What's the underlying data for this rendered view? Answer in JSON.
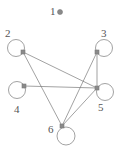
{
  "figure": {
    "type": "graph-diagram",
    "width": 124,
    "height": 149,
    "background_color": "#ffffff",
    "edge_color": "#7a7a7a",
    "node_stroke_color": "#7a7a7a",
    "node_marker_color": "#8a8a8a",
    "label_color": "#555555"
  },
  "nodes": [
    {
      "id": "1",
      "label": "1",
      "label_x": 50,
      "label_y": 6,
      "marker_x": 60,
      "marker_y": 12,
      "marker_shape": "circle",
      "marker_size": 5,
      "has_self_loop": false,
      "loop_cx": 0,
      "loop_cy": 0,
      "loop_r": 0
    },
    {
      "id": "2",
      "label": "2",
      "label_x": 5,
      "label_y": 28,
      "marker_x": 23,
      "marker_y": 52,
      "marker_shape": "square",
      "marker_size": 4,
      "has_self_loop": true,
      "loop_cx": 16,
      "loop_cy": 48,
      "loop_r": 8.5
    },
    {
      "id": "3",
      "label": "3",
      "label_x": 101,
      "label_y": 28,
      "marker_x": 97,
      "marker_y": 52,
      "marker_shape": "square",
      "marker_size": 4,
      "has_self_loop": true,
      "loop_cx": 104,
      "loop_cy": 48,
      "loop_r": 8.5
    },
    {
      "id": "4",
      "label": "4",
      "label_x": 14,
      "label_y": 104,
      "marker_x": 24,
      "marker_y": 86,
      "marker_shape": "square",
      "marker_size": 4,
      "has_self_loop": true,
      "loop_cx": 17,
      "loop_cy": 90,
      "loop_r": 8.5
    },
    {
      "id": "5",
      "label": "5",
      "label_x": 98,
      "label_y": 102,
      "marker_x": 97,
      "marker_y": 88,
      "marker_shape": "square",
      "marker_size": 4,
      "has_self_loop": true,
      "loop_cx": 105,
      "loop_cy": 92,
      "loop_r": 8.5
    },
    {
      "id": "6",
      "label": "6",
      "label_x": 48,
      "label_y": 124,
      "marker_x": 62,
      "marker_y": 126,
      "marker_shape": "square",
      "marker_size": 4,
      "has_self_loop": true,
      "loop_cx": 66,
      "loop_cy": 136,
      "loop_r": 9
    }
  ],
  "edges": [
    {
      "source": "2",
      "target": "5",
      "x1": 23,
      "y1": 52,
      "x2": 97,
      "y2": 88
    },
    {
      "source": "2",
      "target": "6",
      "x1": 23,
      "y1": 52,
      "x2": 62,
      "y2": 126
    },
    {
      "source": "3",
      "target": "5",
      "x1": 97,
      "y1": 52,
      "x2": 97,
      "y2": 88
    },
    {
      "source": "3",
      "target": "6",
      "x1": 97,
      "y1": 52,
      "x2": 62,
      "y2": 126
    },
    {
      "source": "4",
      "target": "5",
      "x1": 24,
      "y1": 86,
      "x2": 97,
      "y2": 88
    },
    {
      "source": "5",
      "target": "6",
      "x1": 97,
      "y1": 88,
      "x2": 62,
      "y2": 126
    }
  ]
}
